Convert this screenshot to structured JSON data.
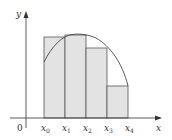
{
  "diagram": {
    "type": "riemann-sum-rectangles-under-curve",
    "axes": {
      "x_label": "x",
      "y_label": "y",
      "origin_label": "0"
    },
    "partition": {
      "points": [
        {
          "base": "x",
          "sub": "0"
        },
        {
          "base": "x",
          "sub": "1"
        },
        {
          "base": "x",
          "sub": "2"
        },
        {
          "base": "x",
          "sub": "3"
        },
        {
          "base": "x",
          "sub": "4"
        }
      ]
    },
    "rectangles_count": 4,
    "colors": {
      "rectangle_fill": "#e3e3e3",
      "rectangle_stroke": "#555555",
      "curve": "#444444",
      "axis": "#333333"
    }
  }
}
